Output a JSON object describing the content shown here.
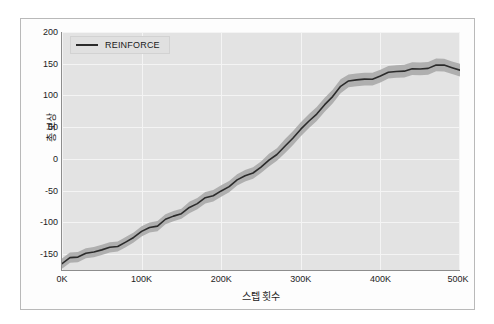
{
  "figure": {
    "background_color": "#ffffff",
    "frame_color": "#b9b9b9",
    "plot_background": "#e3e3e3",
    "grid_color": "#f4f4f4"
  },
  "legend": {
    "position": "upper-left",
    "entries": [
      {
        "label": "REINFORCE",
        "color": "#2b2b2b"
      }
    ]
  },
  "axes": {
    "x_title": "스텝 횟수",
    "y_title": "총 보상",
    "x_ticks": [
      "0K",
      "100K",
      "200K",
      "300K",
      "400K",
      "500K"
    ],
    "y_ticks": [
      "200",
      "150",
      "100",
      "50",
      "0",
      "-50",
      "-100",
      "-150"
    ]
  },
  "chart_data": {
    "type": "line",
    "title": "",
    "subtitle": "",
    "xlabel": "스텝 횟수",
    "ylabel": "총 보상",
    "xlim": [
      0,
      500000
    ],
    "ylim": [
      -175,
      200
    ],
    "x_tick_values": [
      0,
      100000,
      200000,
      300000,
      400000,
      500000
    ],
    "x_tick_labels": [
      "0K",
      "100K",
      "200K",
      "300K",
      "400K",
      "500K"
    ],
    "y_tick_values": [
      200,
      150,
      100,
      50,
      0,
      -50,
      -100,
      -150
    ],
    "y_tick_labels": [
      "200",
      "150",
      "100",
      "50",
      "0",
      "-50",
      "-100",
      "-150"
    ],
    "grid": true,
    "legend_position": "upper left",
    "series": [
      {
        "name": "REINFORCE",
        "color": "#2b2b2b",
        "band_color": "#a8a8a8",
        "band_label": "standard deviation",
        "x": [
          0,
          10000,
          20000,
          30000,
          40000,
          50000,
          60000,
          70000,
          80000,
          90000,
          100000,
          110000,
          120000,
          130000,
          140000,
          150000,
          160000,
          170000,
          180000,
          190000,
          200000,
          210000,
          220000,
          230000,
          240000,
          250000,
          260000,
          270000,
          280000,
          290000,
          300000,
          310000,
          320000,
          330000,
          340000,
          350000,
          360000,
          370000,
          380000,
          390000,
          400000,
          410000,
          420000,
          430000,
          440000,
          450000,
          460000,
          470000,
          480000,
          490000,
          500000
        ],
        "values": [
          -162,
          -158,
          -152,
          -149,
          -146,
          -143,
          -140,
          -136,
          -130,
          -124,
          -117,
          -110,
          -104,
          -98,
          -92,
          -86,
          -79,
          -70,
          -62,
          -57,
          -52,
          -44,
          -34,
          -26,
          -20,
          -12,
          -2,
          10,
          22,
          33,
          44,
          58,
          72,
          86,
          100,
          114,
          120,
          122,
          126,
          124,
          130,
          134,
          138,
          140,
          141,
          140,
          144,
          148,
          150,
          146,
          141
        ],
        "band_lower": [
          -170,
          -166,
          -160,
          -157,
          -154,
          -151,
          -148,
          -144,
          -138,
          -132,
          -125,
          -118,
          -112,
          -106,
          -100,
          -94,
          -88,
          -79,
          -71,
          -66,
          -61,
          -53,
          -43,
          -35,
          -29,
          -21,
          -12,
          0,
          11,
          22,
          33,
          47,
          61,
          75,
          89,
          103,
          110,
          112,
          116,
          114,
          120,
          124,
          128,
          130,
          131,
          130,
          134,
          138,
          140,
          136,
          131
        ],
        "band_upper": [
          -154,
          -150,
          -144,
          -141,
          -138,
          -135,
          -132,
          -128,
          -122,
          -116,
          -109,
          -102,
          -96,
          -90,
          -84,
          -78,
          -70,
          -61,
          -53,
          -48,
          -43,
          -35,
          -25,
          -17,
          -11,
          -3,
          8,
          20,
          33,
          44,
          55,
          69,
          83,
          97,
          111,
          125,
          130,
          132,
          136,
          134,
          140,
          144,
          148,
          150,
          151,
          150,
          154,
          158,
          160,
          156,
          151
        ]
      }
    ]
  }
}
